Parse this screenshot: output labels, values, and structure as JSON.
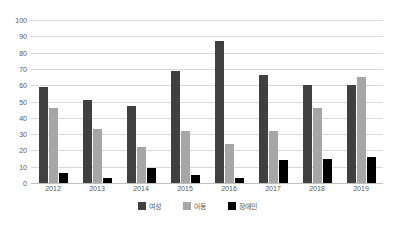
{
  "chart_data": {
    "type": "bar",
    "title": "",
    "xlabel": "",
    "ylabel": "",
    "ylim": [
      0,
      100
    ],
    "ytick_step": 10,
    "grid": true,
    "legend_position": "bottom",
    "categories": [
      "2012",
      "2013",
      "2014",
      "2015",
      "2016",
      "2017",
      "2018",
      "2019"
    ],
    "yticks": [
      "0",
      "10",
      "20",
      "30",
      "40",
      "50",
      "60",
      "70",
      "80",
      "90",
      "100"
    ],
    "series": [
      {
        "name": "여성",
        "color": "#404040",
        "values": [
          59,
          51,
          47,
          69,
          87,
          66,
          60,
          60
        ]
      },
      {
        "name": "아동",
        "color": "#a6a6a6",
        "values": [
          46,
          33,
          22,
          32,
          24,
          32,
          46,
          65
        ]
      },
      {
        "name": "장애인",
        "color": "#000000",
        "values": [
          6,
          3,
          9,
          5,
          3,
          14,
          15,
          16
        ]
      }
    ]
  },
  "colors": {
    "series_0": "#404040",
    "series_1": "#a6a6a6",
    "series_2": "#000000",
    "gridline": "#d9d9d9",
    "axis_text": "#595959",
    "background": "#ffffff"
  }
}
